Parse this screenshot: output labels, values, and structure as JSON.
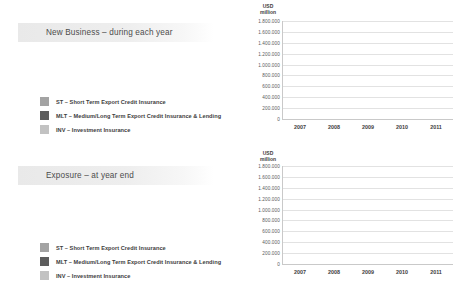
{
  "page": {
    "background": "#ffffff",
    "colors": {
      "st": "#a3a3a3",
      "mlt": "#5d5d5d",
      "inv": "#c2c2c2",
      "gridline": "#e2e2e2",
      "axis": "#c9c9c9",
      "banner_start": "#e9e9e9",
      "text": "#3d3d3d"
    }
  },
  "legend": {
    "items": [
      {
        "key": "st",
        "label": "ST – Short Term Export Credit Insurance",
        "color": "#a3a3a3"
      },
      {
        "key": "mlt",
        "label": "MLT – Medium/Long Term Export Credit Insurance & Lending",
        "color": "#5d5d5d"
      },
      {
        "key": "inv",
        "label": "INV – Investment Insurance",
        "color": "#c2c2c2"
      }
    ]
  },
  "panels": [
    {
      "id": "new-business",
      "banner_title": "New Business – during each year"
    },
    {
      "id": "exposure",
      "banner_title": "Exposure – at year end"
    }
  ],
  "chart_data": [
    {
      "type": "bar",
      "stacked": true,
      "id": "new-business",
      "title": "New Business – during each year",
      "unit_line1": "USD",
      "unit_line2": "million",
      "xlabel": "",
      "ylabel": "USD million",
      "categories": [
        "2007",
        "2008",
        "2009",
        "2010",
        "2011"
      ],
      "ytick_labels": [
        "0",
        "200.000",
        "400.000",
        "600.000",
        "800.000",
        "1.000.000",
        "1.200.000",
        "1.400.000",
        "1.600.000",
        "1.800.000"
      ],
      "ytick_values": [
        0,
        200000,
        400000,
        600000,
        800000,
        1000000,
        1200000,
        1400000,
        1600000,
        1800000
      ],
      "ylim": [
        0,
        1800000
      ],
      "grid": true,
      "legend_position": "left-external",
      "series": [
        {
          "name": "ST – Short Term Export Credit Insurance",
          "key": "st",
          "color": "#a3a3a3",
          "values": [
            1190000,
            1290000,
            1140000,
            1240000,
            1500000
          ]
        },
        {
          "name": "MLT – Medium/Long Term Export Credit Insurance & Lending",
          "key": "mlt",
          "color": "#5d5d5d",
          "values": [
            105000,
            155000,
            195000,
            175000,
            215000
          ]
        },
        {
          "name": "INV – Investment Insurance",
          "key": "inv",
          "color": "#c2c2c2",
          "values": [
            15000,
            25000,
            35000,
            25000,
            35000
          ]
        }
      ],
      "totals": [
        1310000,
        1470000,
        1370000,
        1440000,
        1750000
      ]
    },
    {
      "type": "bar",
      "stacked": true,
      "id": "exposure",
      "title": "Exposure – at year end",
      "unit_line1": "USD",
      "unit_line2": "million",
      "xlabel": "",
      "ylabel": "USD million",
      "categories": [
        "2007",
        "2008",
        "2009",
        "2010",
        "2011"
      ],
      "ytick_labels": [
        "0",
        "200.000",
        "400.000",
        "600.000",
        "800.000",
        "1.000.000",
        "1.200.000",
        "1.400.000",
        "1.600.000",
        "1.800.000"
      ],
      "ytick_values": [
        0,
        200000,
        400000,
        600000,
        800000,
        1000000,
        1200000,
        1400000,
        1600000,
        1800000
      ],
      "ylim": [
        0,
        1800000
      ],
      "grid": true,
      "legend_position": "left-external",
      "series": [
        {
          "name": "INV – Investment Insurance",
          "key": "inv",
          "color": "#c2c2c2",
          "values": [
            900000,
            930000,
            780000,
            860000,
            910000
          ]
        },
        {
          "name": "MLT – Medium/Long Term Export Credit Insurance & Lending",
          "key": "mlt",
          "color": "#5d5d5d",
          "values": [
            520000,
            520000,
            600000,
            590000,
            650000
          ]
        },
        {
          "name": "ST – Short Term Export Credit Insurance",
          "key": "st",
          "color": "#a3a3a3",
          "values": [
            140000,
            140000,
            140000,
            190000,
            200000
          ]
        }
      ],
      "totals": [
        1560000,
        1590000,
        1520000,
        1640000,
        1760000
      ]
    }
  ]
}
